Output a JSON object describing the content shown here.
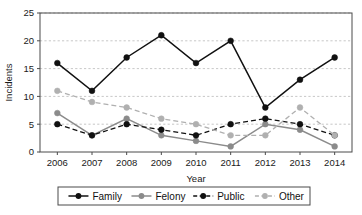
{
  "chart_data": {
    "type": "line",
    "title": "",
    "xlabel": "Year",
    "ylabel": "Incidents",
    "categories": [
      "2006",
      "2007",
      "2008",
      "2009",
      "2010",
      "2011",
      "2012",
      "2013",
      "2014"
    ],
    "x": [
      2006,
      2007,
      2008,
      2009,
      2010,
      2011,
      2012,
      2013,
      2014
    ],
    "ylim": [
      0,
      25
    ],
    "yticks": [
      0,
      5,
      10,
      15,
      20,
      25
    ],
    "grid": "horizontal-dashed",
    "legend_position": "bottom",
    "series": [
      {
        "name": "Family",
        "values": [
          16,
          11,
          17,
          21,
          16,
          20,
          8,
          13,
          17
        ],
        "color": "#111111",
        "line_style": "solid",
        "marker": "circle"
      },
      {
        "name": "Felony",
        "values": [
          7,
          3,
          6,
          3,
          2,
          1,
          5,
          4,
          1
        ],
        "color": "#8b8b8b",
        "line_style": "solid",
        "marker": "circle"
      },
      {
        "name": "Public",
        "values": [
          5,
          3,
          5,
          4,
          3,
          5,
          6,
          5,
          3
        ],
        "color": "#111111",
        "line_style": "dashed",
        "marker": "circle"
      },
      {
        "name": "Other",
        "values": [
          11,
          9,
          8,
          6,
          5,
          3,
          3,
          8,
          3
        ],
        "color": "#b0b0b0",
        "line_style": "dashed",
        "marker": "circle"
      }
    ]
  },
  "axes": {
    "y_tick_labels": [
      "0",
      "5",
      "10",
      "15",
      "20",
      "25"
    ],
    "x_tick_labels": [
      "2006",
      "2007",
      "2008",
      "2009",
      "2010",
      "2011",
      "2012",
      "2013",
      "2014"
    ],
    "y_axis_title": "Incidents",
    "x_axis_title": "Year"
  },
  "legend": {
    "items": [
      {
        "label": "Family"
      },
      {
        "label": "Felony"
      },
      {
        "label": "Public"
      },
      {
        "label": "Other"
      }
    ]
  }
}
